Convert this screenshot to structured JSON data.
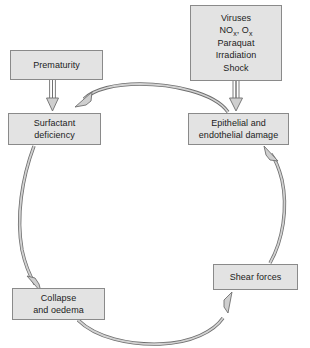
{
  "diagram": {
    "background_color": "#ffffff",
    "box_fill_color": "#e3e3e3",
    "box_border_color": "#8a8a8a",
    "arrow_fill_color": "#d0d0d0",
    "arrow_stroke_color": "#6e6e6e",
    "text_color": "#1c1c1c"
  },
  "nodes": {
    "prematurity": {
      "id": "prematurity",
      "label": "Prematurity"
    },
    "agents": {
      "id": "agents",
      "label": "Viruses\nNOx, Ox\nParaquat\nIrradiation\nShock",
      "lines": [
        "Viruses",
        "NOx, Ox",
        "Paraquat",
        "Irradiation",
        "Shock"
      ],
      "line_1": "Viruses",
      "line_2_prefix": "NO",
      "line_2_sub1": "x",
      "line_2_mid": ", O",
      "line_2_sub2": "x",
      "line_3": "Paraquat",
      "line_4": "Irradiation",
      "line_5": "Shock"
    },
    "surfactant": {
      "id": "surfactant",
      "label": "Surfactant\ndeficiency"
    },
    "epithelial": {
      "id": "epithelial",
      "label": "Epithelial and\nendothelial damage"
    },
    "collapse": {
      "id": "collapse",
      "label": "Collapse\nand oedema"
    },
    "shear": {
      "id": "shear",
      "label": "Shear forces"
    }
  },
  "edges": [
    {
      "id": "prematurity-to-surfactant",
      "from": "prematurity",
      "to": "surfactant",
      "style": "straight-block-arrow",
      "direction": "down"
    },
    {
      "id": "agents-to-epithelial",
      "from": "agents",
      "to": "epithelial",
      "style": "straight-block-arrow",
      "direction": "down"
    },
    {
      "id": "epithelial-to-surfactant",
      "from": "epithelial",
      "to": "surfactant",
      "style": "curved-arc",
      "direction": "leftward-over-top"
    },
    {
      "id": "surfactant-to-collapse",
      "from": "surfactant",
      "to": "collapse",
      "style": "curved-arc",
      "direction": "downward-left-side"
    },
    {
      "id": "collapse-to-shear",
      "from": "collapse",
      "to": "shear",
      "style": "curved-arc",
      "direction": "rightward-under-bottom"
    },
    {
      "id": "shear-to-epithelial",
      "from": "shear",
      "to": "epithelial",
      "style": "curved-arc",
      "direction": "upward-right-side"
    }
  ]
}
